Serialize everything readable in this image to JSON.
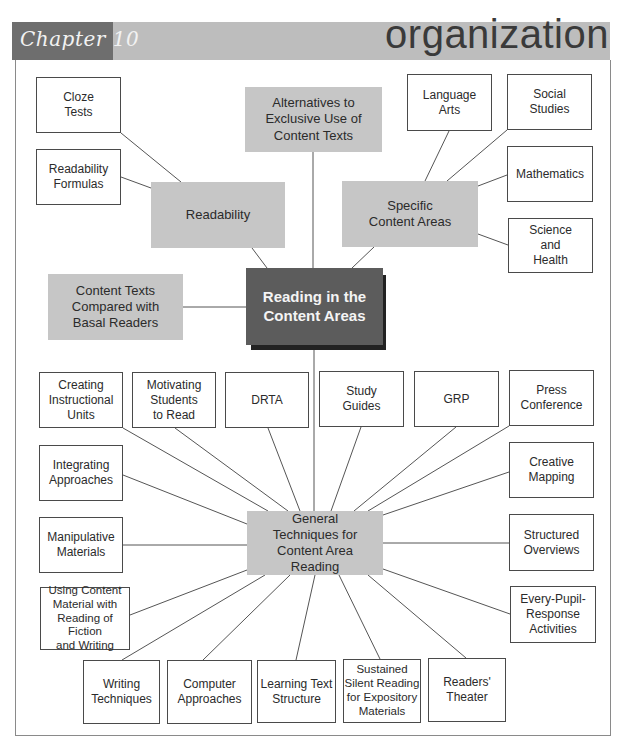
{
  "header": {
    "chapter_label": "Chapter 10",
    "section_title": "organization"
  },
  "colors": {
    "core_fill": "#5c5c5c",
    "hub_fill": "#c6c6c6",
    "leaf_fill": "#ffffff",
    "header_band": "#bdbdbd",
    "chapter_tab": "#6e6e6e"
  },
  "diagram": {
    "core": {
      "id": "core",
      "label": "Reading in the\nContent Areas"
    },
    "hubs": [
      {
        "id": "readability",
        "label": "Readability"
      },
      {
        "id": "alternatives",
        "label": "Alternatives to\nExclusive Use of\nContent Texts"
      },
      {
        "id": "specific",
        "label": "Specific\nContent Areas"
      },
      {
        "id": "compared",
        "label": "Content Texts\nCompared with\nBasal Readers"
      },
      {
        "id": "general",
        "label": "General\nTechniques for\nContent Area\nReading"
      }
    ],
    "leaves": [
      {
        "id": "cloze",
        "parent": "readability",
        "label": "Cloze\nTests"
      },
      {
        "id": "formulas",
        "parent": "readability",
        "label": "Readability\nFormulas"
      },
      {
        "id": "langarts",
        "parent": "specific",
        "label": "Language\nArts"
      },
      {
        "id": "social",
        "parent": "specific",
        "label": "Social\nStudies"
      },
      {
        "id": "math",
        "parent": "specific",
        "label": "Mathematics"
      },
      {
        "id": "science",
        "parent": "specific",
        "label": "Science\nand\nHealth"
      },
      {
        "id": "creating",
        "parent": "general",
        "label": "Creating\nInstructional\nUnits"
      },
      {
        "id": "motivating",
        "parent": "general",
        "label": "Motivating\nStudents\nto Read"
      },
      {
        "id": "drta",
        "parent": "general",
        "label": "DRTA"
      },
      {
        "id": "study",
        "parent": "general",
        "label": "Study\nGuides"
      },
      {
        "id": "grp",
        "parent": "general",
        "label": "GRP"
      },
      {
        "id": "press",
        "parent": "general",
        "label": "Press\nConference"
      },
      {
        "id": "integrating",
        "parent": "general",
        "label": "Integrating\nApproaches"
      },
      {
        "id": "creative",
        "parent": "general",
        "label": "Creative\nMapping"
      },
      {
        "id": "manipulative",
        "parent": "general",
        "label": "Manipulative\nMaterials"
      },
      {
        "id": "structured",
        "parent": "general",
        "label": "Structured\nOverviews"
      },
      {
        "id": "using",
        "parent": "general",
        "label": "Using Content\nMaterial with\nReading of Fiction\nand Writing"
      },
      {
        "id": "everypupil",
        "parent": "general",
        "label": "Every-Pupil-\nResponse\nActivities"
      },
      {
        "id": "writing",
        "parent": "general",
        "label": "Writing\nTechniques"
      },
      {
        "id": "computer",
        "parent": "general",
        "label": "Computer\nApproaches"
      },
      {
        "id": "learning",
        "parent": "general",
        "label": "Learning Text\nStructure"
      },
      {
        "id": "sustained",
        "parent": "general",
        "label": "Sustained\nSilent Reading\nfor Expository\nMaterials"
      },
      {
        "id": "readers",
        "parent": "general",
        "label": "Readers'\nTheater"
      }
    ]
  }
}
